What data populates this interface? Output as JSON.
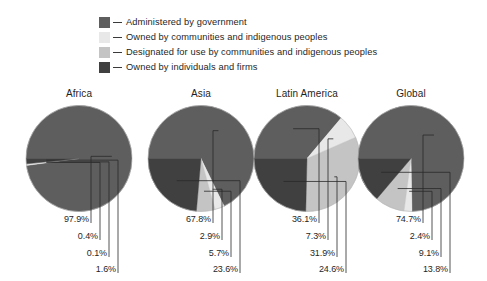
{
  "legend": {
    "items": [
      {
        "label": "Administered by government",
        "color": "#5e5e5e",
        "key": "government"
      },
      {
        "label": "Owned by communities and indigenous peoples",
        "color": "#e8e8e8",
        "key": "owned_communities"
      },
      {
        "label": "Designated for use by communities and indigenous peoples",
        "color": "#c4c4c4",
        "key": "designated_communities"
      },
      {
        "label": "Owned by individuals and firms",
        "color": "#404040",
        "key": "owned_individuals"
      }
    ]
  },
  "chart_data": {
    "type": "pie",
    "title": "",
    "legend_position": "top",
    "units": "percent",
    "categories": [
      "Administered by government",
      "Owned by communities and indigenous peoples",
      "Designated for use by communities and indigenous peoples",
      "Owned by individuals and firms"
    ],
    "colors": [
      "#5e5e5e",
      "#e8e8e8",
      "#c4c4c4",
      "#404040"
    ],
    "panels": [
      {
        "name": "Africa",
        "values": [
          97.9,
          0.4,
          0.1,
          1.6
        ],
        "labels": [
          "97.9%",
          "0.4%",
          "0.1%",
          "1.6%"
        ]
      },
      {
        "name": "Asia",
        "values": [
          67.8,
          2.9,
          5.7,
          23.6
        ],
        "labels": [
          "67.8%",
          "2.9%",
          "5.7%",
          "23.6%"
        ]
      },
      {
        "name": "Latin America",
        "values": [
          36.1,
          7.3,
          31.9,
          24.6
        ],
        "labels": [
          "36.1%",
          "7.3%",
          "31.9%",
          "24.6%"
        ]
      },
      {
        "name": "Global",
        "values": [
          74.7,
          2.4,
          9.1,
          13.8
        ],
        "labels": [
          "74.7%",
          "2.4%",
          "9.1%",
          "13.8%"
        ]
      }
    ]
  }
}
